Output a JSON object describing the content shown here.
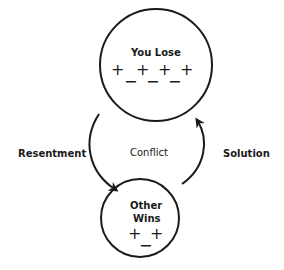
{
  "diagram": {
    "top_node": {
      "label": "You Lose",
      "plus_symbols": [
        "+",
        "+",
        "+",
        "+"
      ],
      "minus_symbols": [
        "−",
        "−",
        "−"
      ]
    },
    "bottom_node": {
      "label_line1": "Other",
      "label_line2": "Wins",
      "plus_symbols": [
        "+",
        "+"
      ],
      "minus_symbols": [
        "−"
      ]
    },
    "center_label": "Conflict",
    "left_edge_label": "Resentment",
    "right_edge_label": "Solution",
    "stroke_color": "#1a1a1a"
  }
}
